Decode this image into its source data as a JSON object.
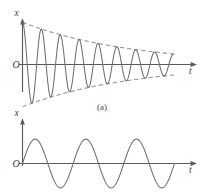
{
  "figure": {
    "width": 207,
    "height": 194,
    "background": "#ffffff",
    "line_color": "#6e6e6e",
    "axis_color": "#5a5a5a",
    "text_color": "#3d3d3d"
  },
  "panels": [
    {
      "id": "panel-a",
      "caption": "(a)",
      "y_axis_label": "x",
      "x_axis_label": "t",
      "origin_label": "O"
    },
    {
      "id": "panel-b",
      "caption": "",
      "y_axis_label": "x",
      "x_axis_label": "t",
      "origin_label": "O"
    }
  ],
  "chart_data": [
    {
      "type": "line",
      "id": "damped-oscillation",
      "title": "",
      "subtitle": "",
      "caption": "(a)",
      "xlabel": "t",
      "ylabel": "x",
      "origin_label": "O",
      "grid": false,
      "legend": null,
      "axis_ticks": [],
      "xlim": [
        0,
        1
      ],
      "ylim": [
        -1.1,
        1.1
      ],
      "description": "Damped harmonic oscillation x(t) = A0 * exp(-b t) * cos(w t), drawn with dashed exponential envelopes above and below.",
      "equation": "x = A0 * exp(-0.30 t) * cos(2 pi t / T)",
      "initial_amplitude": 1.0,
      "final_amplitude": 0.25,
      "cycles": 8,
      "envelope": {
        "style": "dashed",
        "upper_label": "",
        "lower_label": "",
        "start_value": 1.0,
        "end_value": 0.25
      },
      "series": [
        {
          "name": "displacement",
          "x": [
            0.0,
            0.02,
            0.04,
            0.06,
            0.08,
            0.1,
            0.12,
            0.14,
            0.16,
            0.18,
            0.2,
            0.22,
            0.24,
            0.26,
            0.28,
            0.3,
            0.32,
            0.34,
            0.36,
            0.38,
            0.4,
            0.42,
            0.44,
            0.46,
            0.48,
            0.5,
            0.52,
            0.54,
            0.56,
            0.58,
            0.6,
            0.62,
            0.64,
            0.66,
            0.68,
            0.7,
            0.72,
            0.74,
            0.76,
            0.78,
            0.8,
            0.82,
            0.84,
            0.86,
            0.88,
            0.9,
            0.92,
            0.94,
            0.96,
            0.98,
            1.0
          ],
          "values": [
            1.0,
            0.87,
            0.52,
            0.08,
            -0.37,
            -0.72,
            -0.9,
            -0.87,
            -0.64,
            -0.26,
            0.16,
            0.53,
            0.77,
            0.82,
            0.68,
            0.38,
            0.0,
            -0.37,
            -0.64,
            -0.75,
            -0.69,
            -0.47,
            -0.14,
            0.21,
            0.5,
            0.65,
            0.63,
            0.45,
            0.15,
            -0.18,
            -0.45,
            -0.6,
            -0.58,
            -0.41,
            -0.13,
            0.18,
            0.42,
            0.55,
            0.52,
            0.35,
            0.1,
            -0.17,
            -0.38,
            -0.49,
            -0.46,
            -0.31,
            -0.07,
            0.17,
            0.35,
            0.44,
            0.42
          ]
        },
        {
          "name": "upper-envelope",
          "x": [
            0.0,
            0.25,
            0.5,
            0.75,
            1.0
          ],
          "values": [
            1.0,
            0.78,
            0.6,
            0.41,
            0.25
          ]
        },
        {
          "name": "lower-envelope",
          "x": [
            0.0,
            0.25,
            0.5,
            0.75,
            1.0
          ],
          "values": [
            -1.0,
            -0.78,
            -0.6,
            -0.41,
            -0.25
          ]
        }
      ]
    },
    {
      "type": "line",
      "id": "simple-harmonic-oscillation",
      "title": "",
      "subtitle": "",
      "caption": "",
      "xlabel": "t",
      "ylabel": "x",
      "origin_label": "O",
      "grid": false,
      "legend": null,
      "axis_ticks": [],
      "xlim": [
        0,
        1
      ],
      "ylim": [
        -1.1,
        1.1
      ],
      "description": "Undamped simple harmonic oscillation, constant amplitude, three complete cycles.",
      "equation": "x = A * sin(2 pi t / T)",
      "initial_amplitude": 1.0,
      "final_amplitude": 1.0,
      "cycles": 3,
      "envelope": null,
      "series": [
        {
          "name": "displacement",
          "x": [
            0.0,
            0.04,
            0.08,
            0.12,
            0.17,
            0.21,
            0.25,
            0.29,
            0.33,
            0.38,
            0.42,
            0.46,
            0.5,
            0.54,
            0.58,
            0.62,
            0.67,
            0.71,
            0.75,
            0.79,
            0.83,
            0.88,
            0.92,
            0.96,
            1.0
          ],
          "values": [
            0.0,
            0.71,
            1.0,
            0.71,
            0.0,
            -0.71,
            -1.0,
            -0.71,
            0.0,
            0.71,
            1.0,
            0.71,
            0.0,
            -0.71,
            -1.0,
            -0.71,
            0.0,
            0.71,
            1.0,
            0.71,
            0.0,
            -0.71,
            -1.0,
            -0.71,
            0.0
          ]
        }
      ]
    }
  ]
}
